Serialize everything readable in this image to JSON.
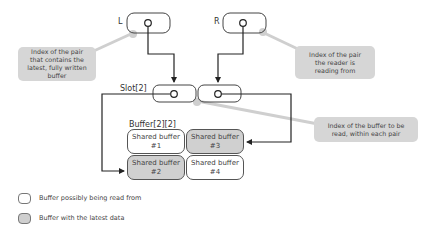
{
  "labels": {
    "left_index": "L",
    "right_index": "R",
    "slot": "Slot[2]",
    "buffer": "Buffer[2][2]"
  },
  "callouts": {
    "left": "Index of the pair that contains the latest, fully written buffer",
    "right": "Index of the pair the reader is reading from",
    "slot": "Index of the buffer to be read, within each pair"
  },
  "buffers": [
    {
      "title": "Shared buffer",
      "num": "#1",
      "state": "possibly-read"
    },
    {
      "title": "Shared buffer",
      "num": "#3",
      "state": "latest"
    },
    {
      "title": "Shared buffer",
      "num": "#2",
      "state": "latest"
    },
    {
      "title": "Shared buffer",
      "num": "#4",
      "state": "possibly-read"
    }
  ],
  "legend": [
    {
      "label": "Buffer possibly being read from",
      "color": "#ffffff"
    },
    {
      "label": "Buffer with the latest data",
      "color": "#cfcfcf"
    }
  ],
  "colors": {
    "latest": "#d0d0d0",
    "callout": "#d6d6d6",
    "line": "#333333"
  }
}
